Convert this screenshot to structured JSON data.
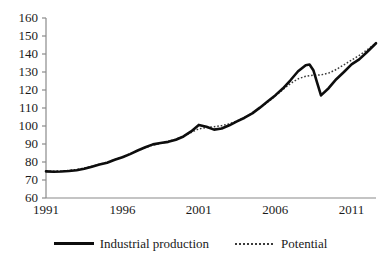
{
  "chart_data": {
    "type": "line",
    "title": "",
    "xlabel": "",
    "ylabel": "",
    "xlim": [
      1991,
      2012.6
    ],
    "ylim": [
      60,
      160
    ],
    "grid": false,
    "legend_position": "bottom",
    "y_ticks": [
      160,
      150,
      140,
      130,
      120,
      110,
      100,
      90,
      80,
      70,
      60
    ],
    "x_ticks": [
      1991,
      1996,
      2001,
      2006,
      2011
    ],
    "x": [
      1991.0,
      1991.5,
      1992.0,
      1992.5,
      1993.0,
      1993.5,
      1994.0,
      1994.5,
      1995.0,
      1995.5,
      1996.0,
      1996.5,
      1997.0,
      1997.5,
      1998.0,
      1998.5,
      1999.0,
      1999.5,
      2000.0,
      2000.5,
      2001.0,
      2001.5,
      2002.0,
      2002.5,
      2003.0,
      2003.5,
      2004.0,
      2004.5,
      2005.0,
      2005.5,
      2006.0,
      2006.5,
      2007.0,
      2007.5,
      2008.0,
      2008.25,
      2008.5,
      2008.75,
      2009.0,
      2009.5,
      2010.0,
      2010.5,
      2011.0,
      2011.5,
      2012.0,
      2012.6
    ],
    "series": [
      {
        "name": "Industrial production",
        "style": "solid",
        "color": "#0d0d0d",
        "values": [
          74.8,
          74.6,
          74.7,
          75.0,
          75.4,
          76.2,
          77.4,
          78.6,
          79.6,
          81.2,
          82.6,
          84.4,
          86.4,
          88.2,
          89.8,
          90.6,
          91.2,
          92.4,
          94.2,
          97.0,
          100.6,
          99.6,
          98.0,
          98.6,
          100.4,
          102.6,
          104.6,
          107.0,
          110.2,
          113.6,
          117.0,
          120.8,
          125.4,
          130.4,
          133.8,
          134.2,
          131.0,
          124.0,
          117.0,
          121.0,
          126.0,
          130.0,
          134.2,
          137.0,
          141.0,
          146.0
        ]
      },
      {
        "name": "Potential",
        "style": "dotted",
        "color": "#3a3a3a",
        "values": [
          74.9,
          74.9,
          75.0,
          75.3,
          75.8,
          76.6,
          77.6,
          78.7,
          79.9,
          81.3,
          82.8,
          84.5,
          86.3,
          88.0,
          89.4,
          90.4,
          91.4,
          92.7,
          94.4,
          96.4,
          98.4,
          99.2,
          99.6,
          100.2,
          101.2,
          102.8,
          104.8,
          107.2,
          110.0,
          113.2,
          116.6,
          120.2,
          123.6,
          126.2,
          127.6,
          128.0,
          128.2,
          128.3,
          128.4,
          129.4,
          131.4,
          134.0,
          136.6,
          139.2,
          142.2,
          146.0
        ]
      }
    ]
  },
  "legend": {
    "items": [
      {
        "label": "Industrial production",
        "style": "solid"
      },
      {
        "label": "Potential",
        "style": "dotted"
      }
    ]
  },
  "axes": {
    "y_tick_labels": [
      "160",
      "150",
      "140",
      "130",
      "120",
      "110",
      "100",
      "90",
      "80",
      "70",
      "60"
    ],
    "x_tick_labels": [
      "1991",
      "1996",
      "2001",
      "2006",
      "2011"
    ],
    "axis_color": "#8a8a8a"
  }
}
